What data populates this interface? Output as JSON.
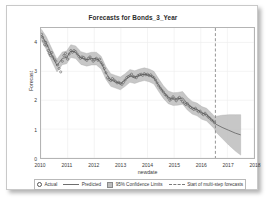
{
  "chart_data": {
    "type": "line",
    "title": "Forecasts for Bonds_3_Year",
    "xlabel": "newdate",
    "ylabel": "Forecast",
    "grid": true,
    "legend_position": "bottom",
    "xlim": [
      2010,
      2018
    ],
    "ylim": [
      0,
      4.5
    ],
    "xticks": [
      "2010",
      "2011",
      "2012",
      "2013",
      "2014",
      "2015",
      "2016",
      "2017",
      "2018"
    ],
    "yticks": [
      "0",
      "1",
      "2",
      "3",
      "4"
    ],
    "forecast_start": 2016.55,
    "series": [
      {
        "name": "Actual",
        "type": "scatter",
        "marker": "open-circle",
        "color": "#555555",
        "x": [
          2010.02,
          2010.06,
          2010.1,
          2010.14,
          2010.18,
          2010.22,
          2010.27,
          2010.31,
          2010.35,
          2010.4,
          2010.44,
          2010.5,
          2010.56,
          2010.62,
          2010.68,
          2010.74,
          2010.8,
          2010.86,
          2010.92,
          2010.96,
          2011.0,
          2011.06,
          2011.12,
          2011.18,
          2011.24,
          2011.3,
          2011.36,
          2011.42,
          2011.48,
          2011.54,
          2011.6,
          2011.66,
          2011.72,
          2011.78,
          2011.84,
          2011.9,
          2011.96,
          2012.02,
          2012.08,
          2012.14,
          2012.2,
          2012.26,
          2012.32,
          2012.38,
          2012.44,
          2012.5,
          2012.56,
          2012.62,
          2012.68,
          2012.74,
          2012.8,
          2012.86,
          2012.92,
          2012.98,
          2013.04,
          2013.1,
          2013.16,
          2013.22,
          2013.28,
          2013.34,
          2013.4,
          2013.46,
          2013.52,
          2013.58,
          2013.64,
          2013.7,
          2013.76,
          2013.82,
          2013.88,
          2013.94,
          2014.0,
          2014.06,
          2014.12,
          2014.18,
          2014.24,
          2014.3,
          2014.36,
          2014.42,
          2014.48,
          2014.54,
          2014.6,
          2014.66,
          2014.72,
          2014.78,
          2014.84,
          2014.9,
          2014.96,
          2015.02,
          2015.08,
          2015.14,
          2015.2,
          2015.26,
          2015.32,
          2015.38,
          2015.44,
          2015.5,
          2015.56,
          2015.62,
          2015.68,
          2015.74,
          2015.8,
          2015.86,
          2015.92,
          2015.98,
          2016.04,
          2016.1,
          2016.16,
          2016.22,
          2016.28,
          2016.34,
          2016.4,
          2016.46,
          2016.52
        ],
        "y": [
          4.28,
          4.18,
          4.05,
          3.92,
          4.0,
          3.88,
          3.72,
          3.62,
          3.55,
          3.65,
          3.5,
          3.42,
          3.35,
          3.22,
          3.1,
          2.98,
          3.35,
          3.55,
          3.62,
          3.5,
          3.42,
          3.6,
          3.72,
          3.66,
          3.72,
          3.68,
          3.6,
          3.52,
          3.45,
          3.5,
          3.48,
          3.42,
          3.38,
          3.45,
          3.5,
          3.42,
          3.35,
          3.4,
          3.45,
          3.38,
          3.42,
          3.3,
          3.22,
          3.1,
          2.95,
          2.78,
          2.72,
          2.68,
          2.75,
          2.7,
          2.65,
          2.6,
          2.62,
          2.58,
          2.55,
          2.62,
          2.7,
          2.78,
          2.82,
          2.85,
          2.9,
          2.82,
          2.8,
          2.78,
          2.85,
          2.88,
          2.9,
          2.86,
          2.92,
          2.88,
          2.9,
          2.85,
          2.88,
          2.82,
          2.78,
          2.7,
          2.6,
          2.5,
          2.42,
          2.35,
          2.28,
          2.2,
          2.15,
          2.08,
          2.0,
          2.05,
          2.12,
          2.05,
          1.98,
          2.05,
          2.1,
          2.02,
          1.95,
          1.9,
          1.85,
          1.88,
          1.8,
          1.75,
          1.72,
          1.68,
          1.72,
          1.65,
          1.6,
          1.62,
          1.55,
          1.5,
          1.55,
          1.48,
          1.42,
          1.38,
          1.32,
          1.28,
          1.22
        ]
      },
      {
        "name": "Predicted",
        "type": "line",
        "color": "#6e6e6e",
        "x": [
          2010.02,
          2010.2,
          2010.44,
          2010.6,
          2010.8,
          2010.96,
          2011.12,
          2011.3,
          2011.5,
          2011.72,
          2011.9,
          2012.08,
          2012.26,
          2012.44,
          2012.62,
          2012.8,
          2012.98,
          2013.16,
          2013.34,
          2013.52,
          2013.7,
          2013.88,
          2014.06,
          2014.24,
          2014.42,
          2014.6,
          2014.78,
          2014.96,
          2015.14,
          2015.32,
          2015.5,
          2015.68,
          2015.86,
          2016.04,
          2016.22,
          2016.4,
          2016.52,
          2016.55,
          2016.8,
          2017.05,
          2017.3,
          2017.5
        ],
        "y": [
          4.25,
          3.98,
          3.5,
          3.2,
          3.45,
          3.48,
          3.7,
          3.66,
          3.46,
          3.4,
          3.44,
          3.44,
          3.3,
          2.94,
          2.7,
          2.64,
          2.58,
          2.7,
          2.84,
          2.8,
          2.86,
          2.9,
          2.86,
          2.78,
          2.52,
          2.28,
          2.1,
          2.04,
          2.05,
          2.08,
          1.88,
          1.74,
          1.68,
          1.56,
          1.5,
          1.34,
          1.22,
          1.18,
          1.06,
          0.96,
          0.86,
          0.8
        ]
      },
      {
        "name": "95% Confidence Limits",
        "type": "band",
        "color": "#bdbdbd",
        "x": [
          2010.02,
          2010.2,
          2010.44,
          2010.6,
          2010.8,
          2010.96,
          2011.12,
          2011.3,
          2011.5,
          2011.72,
          2011.9,
          2012.08,
          2012.26,
          2012.44,
          2012.62,
          2012.8,
          2012.98,
          2013.16,
          2013.34,
          2013.52,
          2013.7,
          2013.88,
          2014.06,
          2014.24,
          2014.42,
          2014.6,
          2014.78,
          2014.96,
          2015.14,
          2015.32,
          2015.5,
          2015.68,
          2015.86,
          2016.04,
          2016.22,
          2016.4,
          2016.52,
          2016.55,
          2016.8,
          2017.05,
          2017.3,
          2017.5
        ],
        "upper": [
          4.45,
          4.2,
          3.72,
          3.42,
          3.67,
          3.7,
          3.92,
          3.88,
          3.68,
          3.62,
          3.66,
          3.66,
          3.52,
          3.16,
          2.92,
          2.86,
          2.8,
          2.92,
          3.06,
          3.02,
          3.08,
          3.12,
          3.08,
          3.0,
          2.74,
          2.5,
          2.32,
          2.26,
          2.27,
          2.3,
          2.1,
          1.96,
          1.9,
          1.78,
          1.72,
          1.56,
          1.44,
          1.44,
          1.48,
          1.5,
          1.5,
          1.5
        ],
        "lower": [
          4.05,
          3.76,
          3.28,
          2.98,
          3.23,
          3.26,
          3.48,
          3.44,
          3.24,
          3.18,
          3.22,
          3.22,
          3.08,
          2.72,
          2.48,
          2.42,
          2.36,
          2.48,
          2.62,
          2.58,
          2.64,
          2.68,
          2.64,
          2.56,
          2.3,
          2.06,
          1.88,
          1.82,
          1.83,
          1.86,
          1.66,
          1.52,
          1.46,
          1.34,
          1.28,
          1.12,
          1.0,
          0.92,
          0.68,
          0.45,
          0.24,
          0.1
        ]
      },
      {
        "name": "Start of multi-step forecasts",
        "type": "vline",
        "color": "#7a7a7a",
        "x": 2016.55
      }
    ]
  },
  "legend": {
    "items": [
      {
        "label": "Actual",
        "symbol": "open-circle"
      },
      {
        "label": "Predicted",
        "symbol": "line"
      },
      {
        "label": "95% Confidence Limits",
        "symbol": "band"
      },
      {
        "label": "Start of multi-step forecasts",
        "symbol": "dashed-line"
      }
    ]
  }
}
